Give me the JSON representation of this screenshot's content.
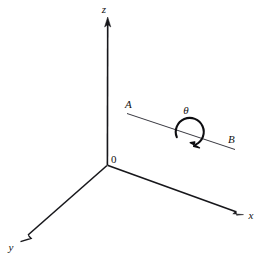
{
  "figure": {
    "background_color": "#ffffff",
    "ink_color": "#17171b",
    "width": 263,
    "height": 268
  },
  "axes": [
    {
      "id": "z-axis",
      "label": "z",
      "label_x": 107,
      "label_y": 12,
      "from": {
        "x": 107,
        "y": 165
      },
      "to": {
        "x": 107.5,
        "y": 19
      },
      "arrow": true
    },
    {
      "id": "x-axis",
      "label": "x",
      "label_x": 251,
      "label_y": 219,
      "from": {
        "x": 107,
        "y": 165
      },
      "to": {
        "x": 243,
        "y": 214
      },
      "arrow": true
    },
    {
      "id": "y-axis",
      "label": "y",
      "label_x": 10,
      "label_y": 250,
      "from": {
        "x": 107,
        "y": 165
      },
      "to": {
        "x": 21,
        "y": 241
      },
      "arrow": true
    }
  ],
  "origin": {
    "label": "0",
    "x": 107,
    "y": 165,
    "label_x": 111,
    "label_y": 163
  },
  "rotation_line": {
    "id": "line-AB",
    "from": {
      "x": 127,
      "y": 113
    },
    "to": {
      "x": 235,
      "y": 149
    },
    "endpoints": [
      {
        "label": "A",
        "label_x": 128,
        "label_y": 108
      },
      {
        "label": "B",
        "label_x": 230,
        "label_y": 142
      }
    ]
  },
  "rotation_arc": {
    "id": "theta-arc",
    "label": "θ",
    "label_x": 186,
    "label_y": 112,
    "center": {
      "x": 190,
      "y": 132
    },
    "radius": 14,
    "start_angle_deg": 200,
    "end_angle_deg": 110,
    "direction": "clockwise",
    "arrowhead_at": {
      "x": 197,
      "y": 146
    }
  }
}
